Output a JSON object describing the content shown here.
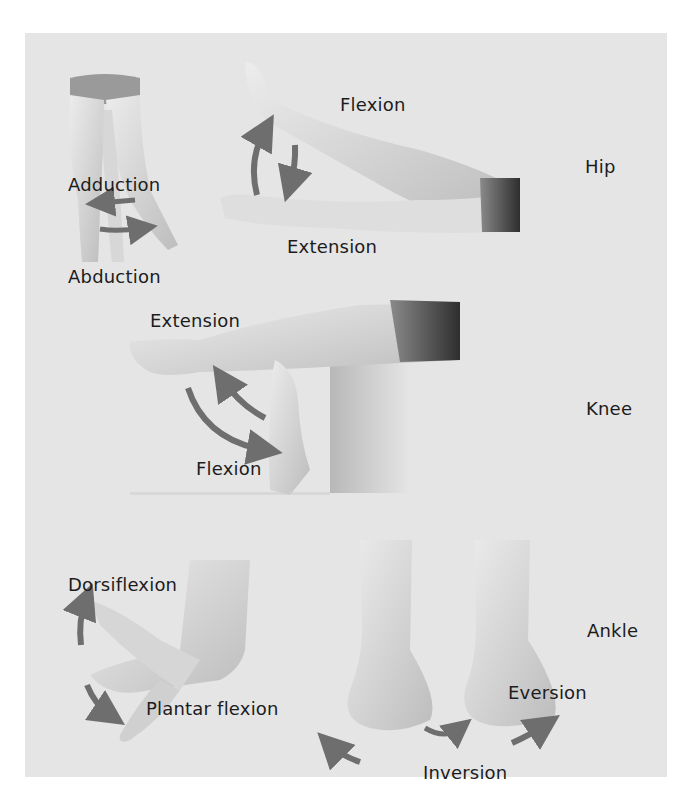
{
  "diagram": {
    "background": "#e5e5e5",
    "page_background": "#ffffff",
    "text_color": "#1c1c1c",
    "arrow_color": "#6e6e6e",
    "skin_color": "#d9d9d9",
    "sections": [
      {
        "joint": "Hip",
        "movements": [
          "Adduction",
          "Abduction",
          "Flexion",
          "Extension"
        ]
      },
      {
        "joint": "Knee",
        "movements": [
          "Extension",
          "Flexion"
        ]
      },
      {
        "joint": "Ankle",
        "movements": [
          "Dorsiflexion",
          "Plantar flexion",
          "Inversion",
          "Eversion"
        ]
      }
    ]
  },
  "labels": {
    "hip": "Hip",
    "hip_adduction": "Adduction",
    "hip_abduction": "Abduction",
    "hip_flexion": "Flexion",
    "hip_extension": "Extension",
    "knee": "Knee",
    "knee_extension": "Extension",
    "knee_flexion": "Flexion",
    "ankle": "Ankle",
    "ankle_dorsiflexion": "Dorsiflexion",
    "ankle_plantar_flexion": "Plantar flexion",
    "ankle_inversion": "Inversion",
    "ankle_eversion": "Eversion"
  }
}
